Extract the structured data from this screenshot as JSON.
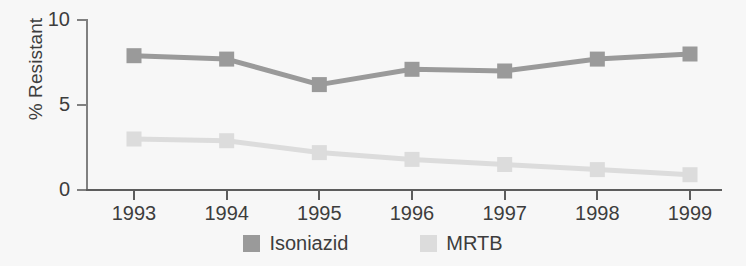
{
  "chart_data": {
    "type": "line",
    "title": "",
    "xlabel": "",
    "ylabel": "% Resistant",
    "categories": [
      "1993",
      "1994",
      "1995",
      "1996",
      "1997",
      "1998",
      "1999"
    ],
    "ylim": [
      0,
      10
    ],
    "yticks": [
      0,
      5,
      10
    ],
    "ytick_labels": [
      "0",
      "5",
      "10"
    ],
    "grid": false,
    "legend_position": "bottom-center",
    "markers": "square",
    "series": [
      {
        "name": "Isoniazid",
        "color": "#9a9a9a",
        "values": [
          7.9,
          7.7,
          6.2,
          7.1,
          7.0,
          7.7,
          8.0
        ]
      },
      {
        "name": "MRTB",
        "color": "#dcdcdc",
        "values": [
          3.0,
          2.9,
          2.2,
          1.8,
          1.5,
          1.2,
          0.9
        ]
      }
    ]
  },
  "colors": {
    "background": "#f7f7f7",
    "axis": "#5d5d5d",
    "y_axis": "#808080",
    "text": "#3d3d3d",
    "isoniazid": "#9a9a9a",
    "mrtb": "#dcdcdc"
  },
  "legend": {
    "items": [
      {
        "label": "Isoniazid",
        "color": "#9a9a9a"
      },
      {
        "label": "MRTB",
        "color": "#dcdcdc"
      }
    ]
  }
}
